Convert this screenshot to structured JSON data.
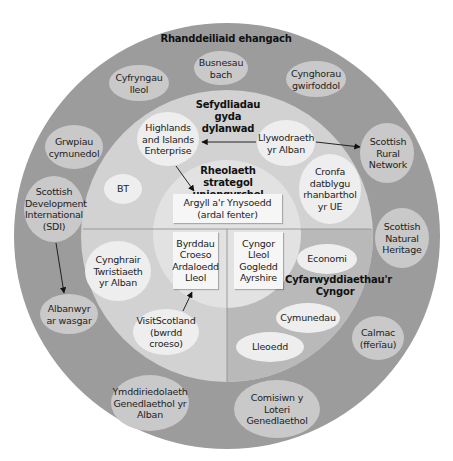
{
  "colors": {
    "outer_ring": "#9c9c9c",
    "middle_ring": "#d2d2d2",
    "middle_ring_council_quadrant": "#b9b9b9",
    "inner_circle": "#e2e2e2",
    "outer_ellipse": "#c9c9c9",
    "middle_ellipse": "#eeeeee",
    "box": "#f6f6f6"
  },
  "rings": {
    "outer": {
      "title": "Rhanddeiliaid ehangach"
    },
    "middle": {
      "title": "Sefydliadau gyda dylanwad"
    },
    "inner": {
      "title": "Rheolaeth strategol uniongyrchol"
    },
    "council": {
      "title": "Cyfarwyddiaethau'r Cyngor"
    }
  },
  "outer_items": [
    {
      "id": "busnesau",
      "label": "Busnesau bach"
    },
    {
      "id": "cyfryngau",
      "label": "Cyfryngau lleol"
    },
    {
      "id": "cynghorau",
      "label": "Cynghorau gwirfoddol"
    },
    {
      "id": "grwpiau",
      "label": "Grwpiau cymunedol"
    },
    {
      "id": "srn",
      "label": "Scottish Rural Network"
    },
    {
      "id": "sdi",
      "label": "Scottish Development International (SDI)"
    },
    {
      "id": "snh",
      "label": "Scottish Natural Heritage"
    },
    {
      "id": "albanwyr",
      "label": "Albanwyr ar wasgar"
    },
    {
      "id": "calmac",
      "label": "Calmac (fferïau)"
    },
    {
      "id": "ymddiriedolaeth",
      "label": "Ymddiriedolaeth Genedlaethol yr Alban"
    },
    {
      "id": "comisiwn",
      "label": "Comisiwn y Loteri Genedlaethol"
    }
  ],
  "middle_items": [
    {
      "id": "hie",
      "label": "Highlands and Islands Enterprise"
    },
    {
      "id": "llywodraeth",
      "label": "Llywodraeth yr Alban"
    },
    {
      "id": "bt",
      "label": "BT"
    },
    {
      "id": "cronfa",
      "label": "Cronfa datblygu rhanbarthol yr UE"
    },
    {
      "id": "cynghrair",
      "label": "Cynghrair Twristiaeth yr Alban"
    },
    {
      "id": "visitscotland",
      "label": "VisitScotland (bwrdd croeso)"
    },
    {
      "id": "economi",
      "label": "Economi"
    },
    {
      "id": "cymunedau",
      "label": "Cymunedau"
    },
    {
      "id": "lleoedd",
      "label": "Lleoedd"
    }
  ],
  "inner_boxes": [
    {
      "id": "argyll",
      "label": "Argyll a'r Ynysoedd (ardal fenter)"
    },
    {
      "id": "byrddau",
      "label": "Byrddau Croeso Ardaloedd Lleol"
    },
    {
      "id": "cyngor",
      "label": "Cyngor Lleol Gogledd Ayrshire"
    }
  ],
  "arrows": [
    {
      "from": "llywodraeth",
      "to": "hie"
    },
    {
      "from": "llywodraeth",
      "to": "srn"
    },
    {
      "from": "hie",
      "to": "argyll"
    },
    {
      "from": "sdi",
      "to": "albanwyr"
    },
    {
      "from": "visitscotland",
      "to": "byrddau"
    }
  ]
}
